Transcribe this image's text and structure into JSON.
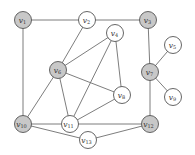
{
  "diagram": {
    "type": "graph",
    "node_radius": 8.5,
    "colors": {
      "highlighted_fill": "#c8c8c8",
      "normal_fill": "#ffffff",
      "stroke": "#555555",
      "edge": "#6e6e6e"
    },
    "nodes": [
      {
        "id": "v1",
        "label": "v",
        "sub": "1",
        "x": 23,
        "y": 20,
        "highlighted": true
      },
      {
        "id": "v2",
        "label": "v",
        "sub": "2",
        "x": 87,
        "y": 20,
        "highlighted": false
      },
      {
        "id": "v3",
        "label": "v",
        "sub": "3",
        "x": 148,
        "y": 20,
        "highlighted": true
      },
      {
        "id": "v4",
        "label": "v",
        "sub": "4",
        "x": 115,
        "y": 33,
        "highlighted": false
      },
      {
        "id": "v5",
        "label": "v",
        "sub": "5",
        "x": 173,
        "y": 45,
        "highlighted": false
      },
      {
        "id": "v6",
        "label": "v",
        "sub": "6",
        "x": 58,
        "y": 70,
        "highlighted": true
      },
      {
        "id": "v7",
        "label": "v",
        "sub": "7",
        "x": 150,
        "y": 72,
        "highlighted": true
      },
      {
        "id": "v8",
        "label": "v",
        "sub": "8",
        "x": 122,
        "y": 95,
        "highlighted": false
      },
      {
        "id": "v9",
        "label": "v",
        "sub": "9",
        "x": 173,
        "y": 97,
        "highlighted": false
      },
      {
        "id": "v10",
        "label": "v",
        "sub": "10",
        "x": 23,
        "y": 124,
        "highlighted": true
      },
      {
        "id": "v11",
        "label": "v",
        "sub": "11",
        "x": 70,
        "y": 124,
        "highlighted": false
      },
      {
        "id": "v12",
        "label": "v",
        "sub": "12",
        "x": 150,
        "y": 124,
        "highlighted": true
      },
      {
        "id": "v13",
        "label": "v",
        "sub": "13",
        "x": 88,
        "y": 140,
        "highlighted": false
      }
    ],
    "edges": [
      [
        "v1",
        "v2"
      ],
      [
        "v2",
        "v3"
      ],
      [
        "v1",
        "v10"
      ],
      [
        "v3",
        "v7"
      ],
      [
        "v7",
        "v5"
      ],
      [
        "v7",
        "v9"
      ],
      [
        "v7",
        "v12"
      ],
      [
        "v2",
        "v6"
      ],
      [
        "v6",
        "v4"
      ],
      [
        "v6",
        "v8"
      ],
      [
        "v6",
        "v11"
      ],
      [
        "v6",
        "v10"
      ],
      [
        "v4",
        "v8"
      ],
      [
        "v4",
        "v11"
      ],
      [
        "v8",
        "v11"
      ],
      [
        "v10",
        "v11"
      ],
      [
        "v11",
        "v12"
      ],
      [
        "v10",
        "v13"
      ],
      [
        "v13",
        "v12"
      ]
    ]
  }
}
